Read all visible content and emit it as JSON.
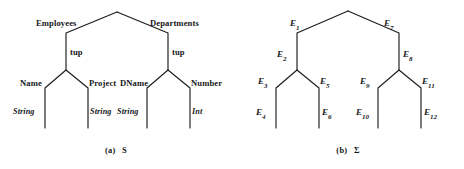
{
  "figures": [
    {
      "id": "figure-a",
      "caption_index": "(a)",
      "caption_symbol": "S",
      "kind": "schema-tree",
      "labels": {
        "root_left_edge": "Employees",
        "root_right_edge": "Departments",
        "left_tup": "tup",
        "right_tup": "tup",
        "left_child_a": "Name",
        "left_child_b": "Project",
        "right_child_a": "DName",
        "right_child_b": "Number",
        "leaf_1": "String",
        "leaf_2": "String",
        "leaf_3": "String",
        "leaf_4": "Int"
      }
    },
    {
      "id": "figure-b",
      "caption_index": "(b)",
      "caption_symbol": "Σ",
      "kind": "symbol-tree",
      "labels": {
        "root_left_edge": "E",
        "root_left_edge_sub": "1",
        "root_right_edge": "E",
        "root_right_edge_sub": "7",
        "left_mid": "E",
        "left_mid_sub": "2",
        "right_mid": "E",
        "right_mid_sub": "8",
        "left_child_a": "E",
        "left_child_a_sub": "3",
        "left_child_b": "E",
        "left_child_b_sub": "5",
        "right_child_a": "E",
        "right_child_a_sub": "9",
        "right_child_b": "E",
        "right_child_b_sub": "11",
        "leaf_1": "E",
        "leaf_1_sub": "4",
        "leaf_2": "E",
        "leaf_2_sub": "6",
        "leaf_3": "E",
        "leaf_3_sub": "10",
        "leaf_4": "E",
        "leaf_4_sub": "12"
      }
    }
  ],
  "style": {
    "ink_color": "#1b1c1e",
    "paper_color": "#ffffff"
  }
}
